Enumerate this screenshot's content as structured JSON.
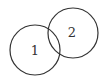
{
  "diagram": {
    "type": "venn",
    "sets": [
      {
        "label": "1",
        "cx": 35,
        "cy": 50,
        "r": 25
      },
      {
        "label": "2",
        "cx": 73,
        "cy": 33,
        "r": 25
      }
    ],
    "stroke_color": "#333333"
  }
}
